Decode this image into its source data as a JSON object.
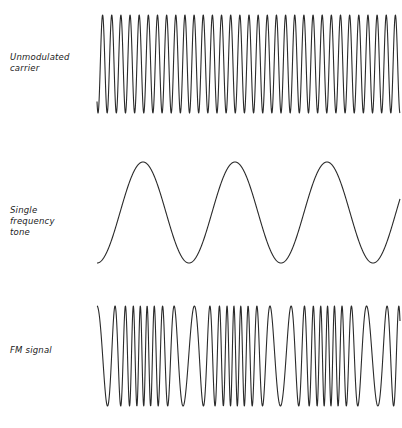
{
  "diagram": {
    "title": "",
    "rows": [
      {
        "id": "carrier",
        "label": "Unmodulated\ncarrier",
        "waveform": {
          "type": "sine",
          "x_start": 97,
          "x_end": 400,
          "y_peak": 15,
          "y_trough": 113,
          "period_px": 9.15,
          "start_phase_deg": 230,
          "approx_cycles": 33
        }
      },
      {
        "id": "tone",
        "label": "Single\nfrequency\ntone",
        "waveform": {
          "type": "sine",
          "x_start": 97,
          "x_end": 400,
          "y_peak": 162,
          "y_trough": 263,
          "period_px": 92,
          "start_phase_deg": 270,
          "approx_cycles": 3.3
        }
      },
      {
        "id": "fm",
        "label": "FM signal",
        "waveform": {
          "type": "fm",
          "x_start": 97,
          "x_end": 400,
          "y_peak": 306,
          "y_trough": 406,
          "carrier_period_px": 10.5,
          "modulation_index": 0.55,
          "modulating_period_px": 92,
          "modulating_start_phase_deg": 270,
          "start_phase_deg": 90,
          "note": "frequency highest where tone peaks, lowest where tone troughs"
        }
      }
    ],
    "colors": {
      "stroke": "#2a2a2a",
      "text": "#1a1a1a",
      "background": "#ffffff"
    }
  }
}
